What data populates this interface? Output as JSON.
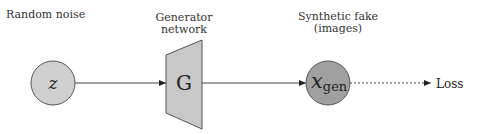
{
  "diagram": {
    "labels": {
      "noise": "Random noise",
      "generator_line1": "Generator",
      "generator_line2": "network",
      "fake_line1": "Synthetic fake",
      "fake_line2": "(images)",
      "loss": "Loss"
    },
    "nodes": {
      "z": {
        "symbol": "z",
        "fill": "#d0d0d0"
      },
      "generator": {
        "symbol": "G",
        "fill": "#c8c8c8"
      },
      "x_gen": {
        "symbol": "x",
        "subscript": "gen",
        "fill": "#a0a0a0"
      }
    },
    "edges": [
      {
        "from": "z",
        "to": "generator",
        "style": "solid"
      },
      {
        "from": "generator",
        "to": "x_gen",
        "style": "solid"
      },
      {
        "from": "x_gen",
        "to": "loss",
        "style": "dotted"
      }
    ],
    "colors": {
      "stroke": "#444444",
      "text": "#222222"
    }
  }
}
